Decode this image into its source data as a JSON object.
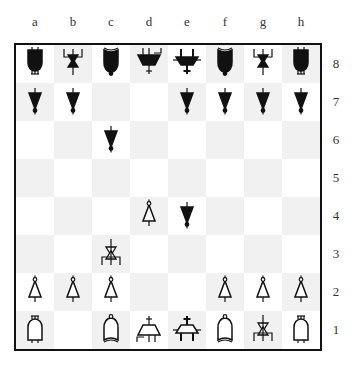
{
  "board": {
    "files": [
      "a",
      "b",
      "c",
      "d",
      "e",
      "f",
      "g",
      "h"
    ],
    "ranks": [
      "8",
      "7",
      "6",
      "5",
      "4",
      "3",
      "2",
      "1"
    ],
    "colors": {
      "light": "#ffffff",
      "dark": "#f1f1f1",
      "border": "#111111",
      "black_piece": "#111111",
      "white_piece": "#ffffff"
    },
    "rows": [
      [
        "bR",
        "bN",
        "bB",
        "bQ",
        "bK",
        "bB",
        "bN",
        "bR"
      ],
      [
        "bP",
        "bP",
        "",
        "",
        "bP",
        "bP",
        "bP",
        "bP"
      ],
      [
        "",
        "",
        "bP",
        "",
        "",
        "",
        "",
        ""
      ],
      [
        "",
        "",
        "",
        "",
        "",
        "",
        "",
        ""
      ],
      [
        "",
        "",
        "",
        "wP",
        "bP",
        "",
        "",
        ""
      ],
      [
        "",
        "",
        "wN",
        "",
        "",
        "",
        "",
        ""
      ],
      [
        "wP",
        "wP",
        "wP",
        "",
        "",
        "wP",
        "wP",
        "wP"
      ],
      [
        "wR",
        "",
        "wB",
        "wQ",
        "wK",
        "wB",
        "wN",
        "wR"
      ]
    ]
  },
  "pieces": {
    "P": "pawn-icon",
    "N": "knight-icon",
    "B": "bishop-icon",
    "R": "rook-icon",
    "Q": "queen-icon",
    "K": "king-icon"
  }
}
